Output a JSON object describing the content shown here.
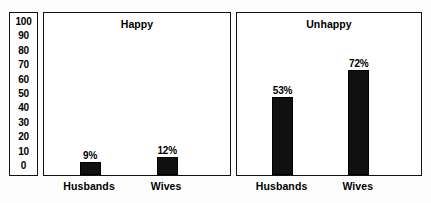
{
  "chart_data": {
    "type": "bar",
    "title": "",
    "xlabel": "",
    "ylabel": "",
    "ylim": [
      0,
      100
    ],
    "grid": false,
    "legend": "none",
    "y_ticks": [
      100,
      90,
      80,
      70,
      60,
      50,
      40,
      30,
      20,
      10,
      0
    ],
    "y_tick_labels": [
      "100",
      "90",
      "80",
      "70",
      "60",
      "50",
      "40",
      "30",
      "20",
      "10",
      "0"
    ],
    "categories": [
      "Husbands",
      "Wives"
    ],
    "panels": [
      {
        "title": "Happy",
        "categories": [
          "Husbands",
          "Wives"
        ],
        "values": [
          9,
          12
        ],
        "value_labels": [
          "9%",
          "12%"
        ]
      },
      {
        "title": "Unhappy",
        "categories": [
          "Husbands",
          "Wives"
        ],
        "values": [
          53,
          72
        ],
        "value_labels": [
          "53%",
          "72%"
        ]
      }
    ],
    "colors": {
      "bar": "#101010",
      "border": "#111111",
      "background": "#ffffff",
      "text": "#000000"
    }
  }
}
